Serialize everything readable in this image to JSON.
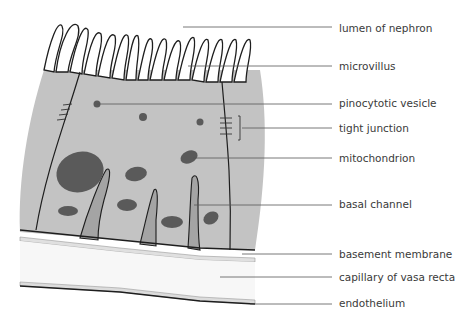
{
  "colors": {
    "cytoplasm": "#c3c3c3",
    "organelle": "#5a5a5a",
    "channel": "#a4a4a4",
    "membrane_line": "#1e1e1e",
    "leader_line": "#555555",
    "label_text": "#3a3a3a",
    "capillary": "#f7f7f7",
    "endothelium": "#dcdcdc"
  },
  "labels": [
    {
      "id": "lumen",
      "text": "lumen of nephron",
      "y": 28
    },
    {
      "id": "microvillus",
      "text": "microvillus",
      "y": 66
    },
    {
      "id": "vesicle",
      "text": "pinocytotic vesicle",
      "y": 103
    },
    {
      "id": "tight_junction",
      "text": "tight junction",
      "y": 128
    },
    {
      "id": "mitochondrion",
      "text": "mitochondrion",
      "y": 158
    },
    {
      "id": "basal_channel",
      "text": "basal channel",
      "y": 204
    },
    {
      "id": "basement_membrane",
      "text": "basement membrane",
      "y": 254
    },
    {
      "id": "capillary",
      "text": "capillary of vasa recta",
      "y": 277
    },
    {
      "id": "endothelium",
      "text": "endothelium",
      "y": 303
    }
  ]
}
